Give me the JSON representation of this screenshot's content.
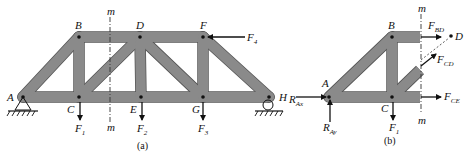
{
  "figure": {
    "panel_a": {
      "caption": "(a)",
      "joints": {
        "A": "A",
        "B": "B",
        "C": "C",
        "D": "D",
        "E": "E",
        "F": "F",
        "G": "G",
        "H": "H"
      },
      "cut_label_top": "m",
      "cut_label_bottom": "m",
      "loads": {
        "F1": {
          "main": "F",
          "sub": "1"
        },
        "F2": {
          "main": "F",
          "sub": "2"
        },
        "F3": {
          "main": "F",
          "sub": "3"
        },
        "F4": {
          "main": "F",
          "sub": "4"
        }
      }
    },
    "panel_b": {
      "caption": "(b)",
      "joints": {
        "A": "A",
        "B": "B",
        "C": "C",
        "D": "D"
      },
      "cut_label_top": "m",
      "cut_label_bottom": "m",
      "forces": {
        "RAx": {
          "main": "R",
          "sub": "Ax"
        },
        "RAy": {
          "main": "R",
          "sub": "Ay"
        },
        "F1": {
          "main": "F",
          "sub": "1"
        },
        "FBD": {
          "main": "F",
          "sub": "BD"
        },
        "FCD": {
          "main": "F",
          "sub": "CD"
        },
        "FCE": {
          "main": "F",
          "sub": "CE"
        }
      }
    }
  }
}
